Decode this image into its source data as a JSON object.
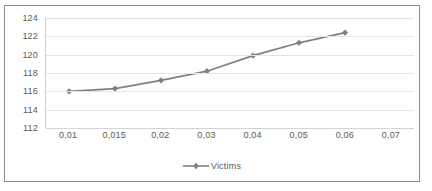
{
  "chart_data": {
    "type": "line",
    "title": "",
    "xlabel": "",
    "ylabel": "",
    "categories": [
      "0,01",
      "0,015",
      "0,02",
      "0,03",
      "0,04",
      "0,05",
      "0,06",
      "0,07"
    ],
    "x_values": [
      0.01,
      0.015,
      0.02,
      0.03,
      0.04,
      0.05,
      0.06,
      0.07
    ],
    "series": [
      {
        "name": "Victims",
        "color": "#808080",
        "marker": "diamond",
        "values": [
          116.0,
          116.3,
          117.2,
          118.2,
          119.9,
          121.3,
          122.4,
          null
        ]
      }
    ],
    "y_ticks": [
      112,
      114,
      116,
      118,
      120,
      122,
      124
    ],
    "ylim": [
      112,
      124
    ],
    "grid": true,
    "grid_axis": "y",
    "legend": {
      "position": "bottom",
      "entries": [
        {
          "label": "Victims",
          "color": "#808080"
        }
      ]
    }
  },
  "colors": {
    "series": "#808080",
    "gridline": "#e4e4e4",
    "axis": "#d3d3d3",
    "tick_text": "#595959",
    "frame": "#8a8a8a",
    "background": "#ffffff"
  }
}
